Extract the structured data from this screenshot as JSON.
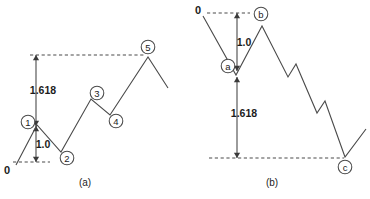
{
  "figure": {
    "stroke_color": "#4a4a4a",
    "text_color": "#1c1c1c",
    "background": "#ffffff"
  },
  "panels": [
    {
      "id": "a",
      "caption": "(a)",
      "caption_x": 85,
      "caption_y": 182,
      "description": "Impulse wave 0-1-2-3-4-5 with Fibonacci extension",
      "origin_label": "0",
      "origin_x": 7,
      "origin_y": 170,
      "nodes": [
        {
          "label": "1",
          "cx": 28,
          "cy": 122,
          "r": 6.8
        },
        {
          "label": "2",
          "cx": 67,
          "cy": 158,
          "r": 6.8
        },
        {
          "label": "3",
          "cx": 97,
          "cy": 93,
          "r": 6.8
        },
        {
          "label": "4",
          "cx": 116,
          "cy": 121,
          "r": 6.8
        },
        {
          "label": "5",
          "cx": 148,
          "cy": 47,
          "r": 6.8
        }
      ],
      "wave_path": "M 16,165 L 37,125 L 61,152 L 91,99 L 110,115 L 148,57 L 168,88",
      "guides": [
        {
          "name": "upper-extension-guide",
          "x1": 30,
          "y1": 55,
          "x2": 146,
          "y2": 55
        },
        {
          "name": "origin-base-guide",
          "x1": 13,
          "y1": 162,
          "x2": 50,
          "y2": 162
        }
      ],
      "measures": [
        {
          "name": "fib-extension-measure",
          "value": "1.618",
          "x": 36,
          "y_top": 55,
          "y_bottom": 126,
          "label_x": 43,
          "label_y": 90
        },
        {
          "name": "wave-one-unit-measure",
          "value": "1.0",
          "x": 36,
          "y_top": 126,
          "y_bottom": 162,
          "label_x": 43,
          "label_y": 144
        }
      ]
    },
    {
      "id": "b",
      "caption": "(b)",
      "caption_x": 272,
      "caption_y": 182,
      "description": "Corrective wave 0-a-b-c with Fibonacci extension",
      "origin_label": "0",
      "origin_x": 198,
      "origin_y": 10,
      "nodes": [
        {
          "label": "a",
          "cx": 228,
          "cy": 66,
          "r": 6.8
        },
        {
          "label": "b",
          "cx": 261,
          "cy": 14,
          "r": 6.8
        },
        {
          "label": "c",
          "cx": 345,
          "cy": 167,
          "r": 6.8
        }
      ],
      "wave_path": "M 203,16 L 236,75 L 262,26 L 288,77 L 296,64 L 317,113 L 325,101 L 345,157 L 366,129",
      "guides": [
        {
          "name": "origin-top-guide",
          "x1": 207,
          "y1": 13,
          "x2": 250,
          "y2": 13
        },
        {
          "name": "wave-c-base-guide",
          "x1": 209,
          "y1": 158,
          "x2": 344,
          "y2": 158
        }
      ],
      "measures": [
        {
          "name": "wave-a-unit-measure",
          "value": "1.0",
          "x": 237,
          "y_top": 13,
          "y_bottom": 71,
          "label_x": 244,
          "label_y": 42
        },
        {
          "name": "fib-extension-measure",
          "value": "1.618",
          "x": 237,
          "y_top": 77,
          "y_bottom": 158,
          "label_x": 244,
          "label_y": 113
        }
      ]
    }
  ],
  "chart_data": {
    "type": "line",
    "xlabel": "",
    "ylabel": "",
    "grid": false,
    "legend": "none",
    "annotations": [
      "1.618",
      "1.0",
      "0",
      "(a)",
      "(b)"
    ],
    "series": [
      {
        "name": "impulse-wave-a",
        "points": [
          {
            "x": 16,
            "y": 165,
            "label": "0"
          },
          {
            "x": 37,
            "y": 125,
            "label": "1"
          },
          {
            "x": 61,
            "y": 152,
            "label": "2"
          },
          {
            "x": 91,
            "y": 99,
            "label": "3"
          },
          {
            "x": 110,
            "y": 115,
            "label": "4"
          },
          {
            "x": 148,
            "y": 57,
            "label": "5"
          },
          {
            "x": 168,
            "y": 88,
            "label": ""
          }
        ]
      },
      {
        "name": "corrective-wave-b",
        "points": [
          {
            "x": 203,
            "y": 16,
            "label": "0"
          },
          {
            "x": 236,
            "y": 75,
            "label": "a"
          },
          {
            "x": 262,
            "y": 26,
            "label": "b"
          },
          {
            "x": 288,
            "y": 77,
            "label": ""
          },
          {
            "x": 296,
            "y": 64,
            "label": ""
          },
          {
            "x": 317,
            "y": 113,
            "label": ""
          },
          {
            "x": 325,
            "y": 101,
            "label": ""
          },
          {
            "x": 345,
            "y": 157,
            "label": "c"
          },
          {
            "x": 366,
            "y": 129,
            "label": ""
          }
        ]
      }
    ]
  }
}
